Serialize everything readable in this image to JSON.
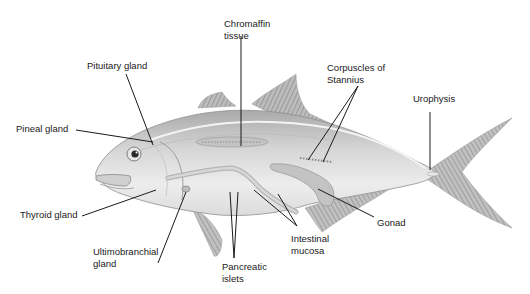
{
  "diagram": {
    "colors": {
      "background": "#ffffff",
      "body_fill": "#d6d6d6",
      "body_light": "#ececec",
      "fin_fill": "#b4b4b4",
      "organ_fill": "#c9c9c9",
      "leader_line": "#1a1a1a",
      "label_text": "#1a1a1a"
    },
    "labels": [
      {
        "id": "chromaffin",
        "lines": [
          "Chromaffin",
          "tissue"
        ]
      },
      {
        "id": "pituitary",
        "lines": [
          "Pituitary gland"
        ]
      },
      {
        "id": "corpuscles",
        "lines": [
          "Corpuscles of",
          "Stannius"
        ]
      },
      {
        "id": "urophysis",
        "lines": [
          "Urophysis"
        ]
      },
      {
        "id": "pineal",
        "lines": [
          "Pineal gland"
        ]
      },
      {
        "id": "thyroid",
        "lines": [
          "Thyroid gland"
        ]
      },
      {
        "id": "gonad",
        "lines": [
          "Gonad"
        ]
      },
      {
        "id": "intestinal",
        "lines": [
          "Intestinal",
          "mucosa"
        ]
      },
      {
        "id": "ultimobranchial",
        "lines": [
          "Ultimobranchial",
          "gland"
        ]
      },
      {
        "id": "pancreatic",
        "lines": [
          "Pancreatic",
          "islets"
        ]
      }
    ]
  }
}
